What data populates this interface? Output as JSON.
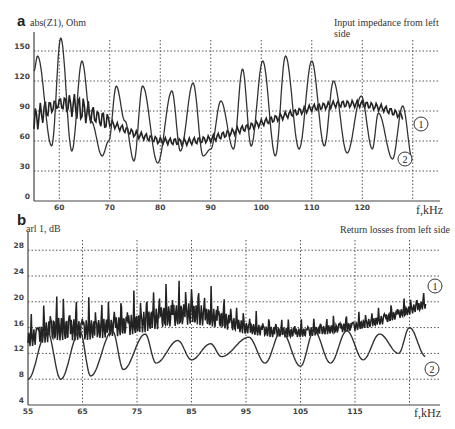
{
  "figure": {
    "panel_a": {
      "letter": "a",
      "ylabel": "abs(Z1), Ohm",
      "title": "Input impedance from left side",
      "xunit": "f,kHz",
      "yticks": [
        "0",
        "30",
        "60",
        "90",
        "120",
        "150"
      ],
      "xticks": [
        "60",
        "70",
        "80",
        "90",
        "100",
        "110",
        "120"
      ],
      "curve_labels": [
        "1",
        "2"
      ]
    },
    "panel_b": {
      "letter": "b",
      "ylabel": "arl 1, dB",
      "title": "Return losses from left side",
      "xunit": "f,kHz",
      "yticks": [
        "4",
        "8",
        "12",
        "16",
        "20",
        "24",
        "28"
      ],
      "xticks": [
        "55",
        "65",
        "75",
        "85",
        "95",
        "105",
        "115"
      ],
      "curve_labels": [
        "1",
        "2"
      ]
    }
  },
  "chart_data": [
    {
      "type": "line",
      "title": "Input impedance from left side",
      "panel": "a",
      "xlabel": "f,kHz",
      "ylabel": "abs(Z1), Ohm",
      "xlim": [
        55,
        130
      ],
      "ylim": [
        0,
        165
      ],
      "grid": true,
      "xticks": [
        60,
        70,
        80,
        90,
        100,
        110,
        120
      ],
      "yticks": [
        0,
        30,
        60,
        90,
        120,
        150
      ],
      "series": [
        {
          "name": "1",
          "description": "rapidly oscillating curve (small ripple ~±8 Ohm) following a smooth envelope",
          "x": [
            55,
            57,
            60,
            63,
            66,
            70,
            75,
            80,
            85,
            90,
            95,
            100,
            105,
            110,
            115,
            120,
            124,
            128
          ],
          "values": [
            80,
            90,
            98,
            95,
            88,
            78,
            67,
            60,
            59,
            62,
            70,
            78,
            86,
            93,
            97,
            97,
            93,
            85
          ]
        },
        {
          "name": "2",
          "description": "large periodic resonance oscillation, peaks and troughs",
          "x": [
            55,
            55.7,
            58.5,
            60.3,
            62.5,
            64.5,
            66.3,
            68.5,
            69.8,
            71.3,
            73,
            74.8,
            76.5,
            79.5,
            82.3,
            84,
            86.5,
            88.5,
            90,
            92,
            94.5,
            96.3,
            98,
            100.3,
            102.8,
            104.8,
            107.5,
            110,
            112.5,
            114.3,
            117,
            119.8,
            122,
            123.2,
            126,
            128,
            130
          ],
          "values": [
            130,
            145,
            55,
            163,
            50,
            140,
            80,
            45,
            60,
            115,
            80,
            40,
            115,
            38,
            110,
            50,
            118,
            45,
            52,
            100,
            52,
            132,
            55,
            140,
            45,
            145,
            52,
            140,
            55,
            120,
            48,
            105,
            52,
            88,
            42,
            95,
            40
          ]
        }
      ]
    },
    {
      "type": "line",
      "title": "Return losses from left side",
      "panel": "b",
      "xlabel": "f,kHz",
      "ylabel": "arl 1, dB",
      "xlim": [
        55,
        130
      ],
      "ylim": [
        4,
        30
      ],
      "grid": true,
      "xticks": [
        55,
        65,
        75,
        85,
        95,
        105,
        115
      ],
      "yticks": [
        4,
        8,
        12,
        16,
        20,
        24,
        28
      ],
      "series": [
        {
          "name": "1",
          "description": "dense comb-like oscillation; envelope lower/upper bounds",
          "x": [
            55,
            60,
            65,
            70,
            75,
            80,
            85,
            90,
            95,
            100,
            105,
            110,
            115,
            120,
            125,
            128
          ],
          "values_lower": [
            13,
            14,
            14,
            14.5,
            15,
            16,
            16.5,
            16,
            15,
            14.5,
            14.5,
            15,
            15.5,
            16.5,
            18,
            19
          ],
          "values_upper": [
            18,
            22,
            21,
            21,
            22,
            23.5,
            24,
            22,
            19,
            18,
            17.5,
            18,
            18.5,
            19.5,
            21,
            22
          ]
        },
        {
          "name": "2",
          "description": "sawtooth-like resonant curve with peaks and smooth troughs",
          "x": [
            55,
            58.5,
            61,
            64.5,
            66.5,
            70.5,
            72.5,
            76.5,
            78.5,
            82.5,
            85,
            88.5,
            90.5,
            95.5,
            98.5,
            101.5,
            105,
            107.5,
            110.5,
            113.5,
            116.5,
            119.5,
            123,
            125,
            128
          ],
          "values": [
            8,
            15.5,
            8,
            15.5,
            8.5,
            15.5,
            9.5,
            15,
            10.5,
            14,
            11,
            13.5,
            11.5,
            14.5,
            10.5,
            15.5,
            10,
            15.5,
            10.5,
            15.5,
            11,
            15,
            12,
            16,
            11.5
          ]
        }
      ]
    }
  ]
}
